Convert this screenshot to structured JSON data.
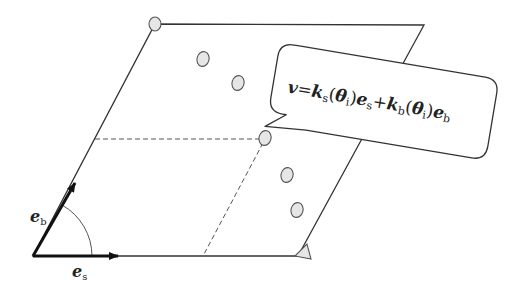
{
  "diagram": {
    "type": "parallelogram-basis-vectors",
    "colors": {
      "line": "#333333",
      "dashed": "#555555",
      "point_fill": "#e6e6e6",
      "point_stroke": "#555555",
      "background": "#ffffff"
    },
    "parallelogram": {
      "origin": [
        33,
        256
      ],
      "bottom_right": [
        298,
        256
      ],
      "top_left": [
        155,
        24
      ],
      "top_right": [
        424,
        25
      ]
    },
    "basis_vectors": [
      {
        "name": "e_s",
        "label_base": "e",
        "label_sub": "s",
        "from": [
          33,
          256
        ],
        "to": [
          118,
          256
        ]
      },
      {
        "name": "e_b",
        "label_base": "e",
        "label_sub": "b",
        "from": [
          33,
          256
        ],
        "to": [
          75,
          183
        ]
      }
    ],
    "points": [
      {
        "id": "corner-top-left",
        "cx": 155,
        "cy": 24
      },
      {
        "id": "p1",
        "cx": 203,
        "cy": 59
      },
      {
        "id": "p2",
        "cx": 238,
        "cy": 83
      },
      {
        "id": "p-highlighted",
        "cx": 265,
        "cy": 138
      },
      {
        "id": "p3",
        "cx": 287,
        "cy": 175
      },
      {
        "id": "p4",
        "cx": 297,
        "cy": 210
      }
    ],
    "dashed_lines": [
      {
        "from": [
          95,
          139
        ],
        "to": [
          265,
          139
        ]
      },
      {
        "from": [
          265,
          139
        ],
        "to": [
          203,
          256
        ]
      }
    ],
    "callout": {
      "equation": {
        "lhs": "v",
        "equals": "=",
        "term1_coeff": "k",
        "term1_coeff_sub": "s",
        "term1_arg": "θ",
        "term1_arg_sub": "i",
        "term1_vec": "e",
        "term1_vec_sub": "s",
        "plus": "+",
        "term2_coeff": "k",
        "term2_coeff_sub": "b",
        "term2_arg": "θ",
        "term2_arg_sub": "i",
        "term2_vec": "e",
        "term2_vec_sub": "b"
      },
      "rotation_deg": 9.5
    },
    "corner_marker": {
      "shape": "triangle",
      "at": [
        298,
        256
      ]
    }
  }
}
